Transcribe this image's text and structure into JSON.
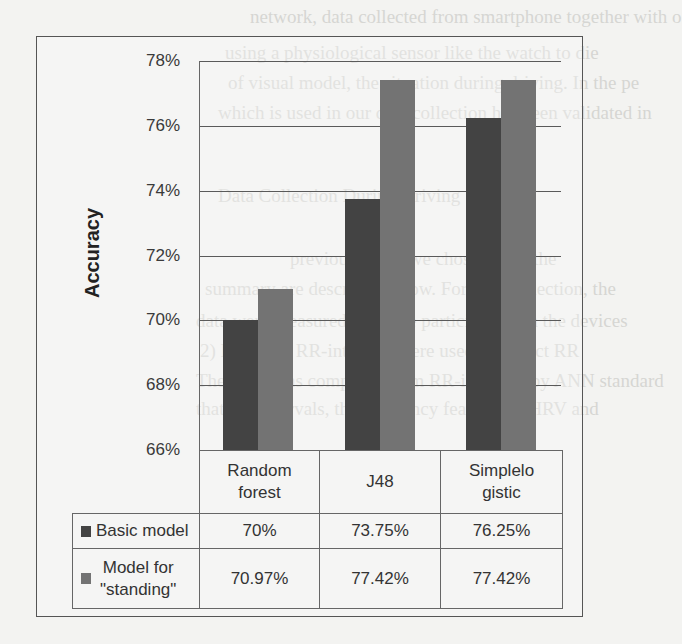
{
  "background_text": [
    {
      "text": "network, data collected from smartphone together with o",
      "x": 250,
      "y": 6
    },
    {
      "text": "using a physiological sensor like the watch to die",
      "x": 225,
      "y": 42
    },
    {
      "text": "of visual model, the situation during driving. In the pe",
      "x": 228,
      "y": 72
    },
    {
      "text": "which is used in our data collection has been validated in",
      "x": 218,
      "y": 102
    },
    {
      "text": "Data Collection During Driving",
      "x": 218,
      "y": 185
    },
    {
      "text": "previous work, we chose to use the",
      "x": 290,
      "y": 248
    },
    {
      "text": "summary are described below. For data collection, the",
      "x": 205,
      "y": 278
    },
    {
      "text": "data were measured from the participants via the devices",
      "x": 196,
      "y": 310
    },
    {
      "text": "2) HRV and RR-intervals were used to collect RR",
      "x": 200,
      "y": 340
    },
    {
      "text": "The HRV was computed from RR-intervals by ANN standard",
      "x": 196,
      "y": 370
    },
    {
      "text": "that RR intervals, the frequency features of HRV and",
      "x": 196,
      "y": 398
    }
  ],
  "chart_data": {
    "type": "bar",
    "title": "",
    "xlabel": "",
    "ylabel": "Accuracy",
    "ylim": [
      66,
      78
    ],
    "yticks": [
      "66%",
      "68%",
      "70%",
      "72%",
      "74%",
      "76%",
      "78%"
    ],
    "grid": true,
    "legend_position": "data-table-left",
    "categories": [
      "Random forest",
      "J48",
      "Simplelogistic"
    ],
    "category_labels": [
      [
        "Random",
        "forest"
      ],
      [
        "J48"
      ],
      [
        "Simplelo",
        "gistic"
      ]
    ],
    "series": [
      {
        "name": "Basic model",
        "color": "#434343",
        "values": [
          70,
          73.75,
          76.25
        ],
        "labels": [
          "70%",
          "73.75%",
          "76.25%"
        ]
      },
      {
        "name": "Model for \"standing\"",
        "color": "#737373",
        "values": [
          70.97,
          77.42,
          77.42
        ],
        "labels": [
          "70.97%",
          "77.42%",
          "77.42%"
        ]
      }
    ]
  },
  "legend": {
    "basic": "Basic model",
    "standing_line1": "Model for",
    "standing_line2": "\"standing\""
  }
}
